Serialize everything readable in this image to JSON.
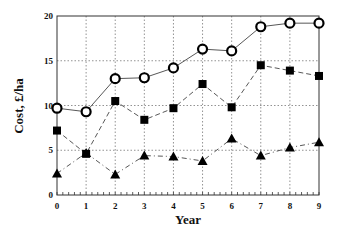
{
  "chart_data": {
    "type": "line",
    "title": "",
    "xlabel": "Year",
    "ylabel": "Cost, £/ha",
    "x": [
      0,
      1,
      2,
      3,
      4,
      5,
      6,
      7,
      8,
      9
    ],
    "xticks": [
      "0",
      "1",
      "2",
      "3",
      "4",
      "5",
      "6",
      "7",
      "8",
      "9"
    ],
    "yticks": [
      "0",
      "5",
      "10",
      "15",
      "20"
    ],
    "xlim": [
      0,
      9
    ],
    "ylim": [
      0,
      20
    ],
    "grid": true,
    "legend": null,
    "series": [
      {
        "name": "circles (solid line)",
        "marker": "circle-open",
        "line": "solid",
        "values": [
          9.7,
          9.3,
          13.0,
          13.1,
          14.2,
          16.3,
          16.1,
          18.8,
          19.2,
          19.2
        ]
      },
      {
        "name": "squares (dashed line)",
        "marker": "square-filled",
        "line": "dashed",
        "values": [
          7.2,
          4.6,
          10.5,
          8.4,
          9.7,
          12.4,
          9.8,
          14.5,
          13.9,
          13.3
        ]
      },
      {
        "name": "triangles (dash-dot line)",
        "marker": "triangle-filled",
        "line": "dashdot",
        "values": [
          2.4,
          4.7,
          2.3,
          4.4,
          4.3,
          3.8,
          6.3,
          4.4,
          5.3,
          5.9
        ]
      }
    ]
  }
}
